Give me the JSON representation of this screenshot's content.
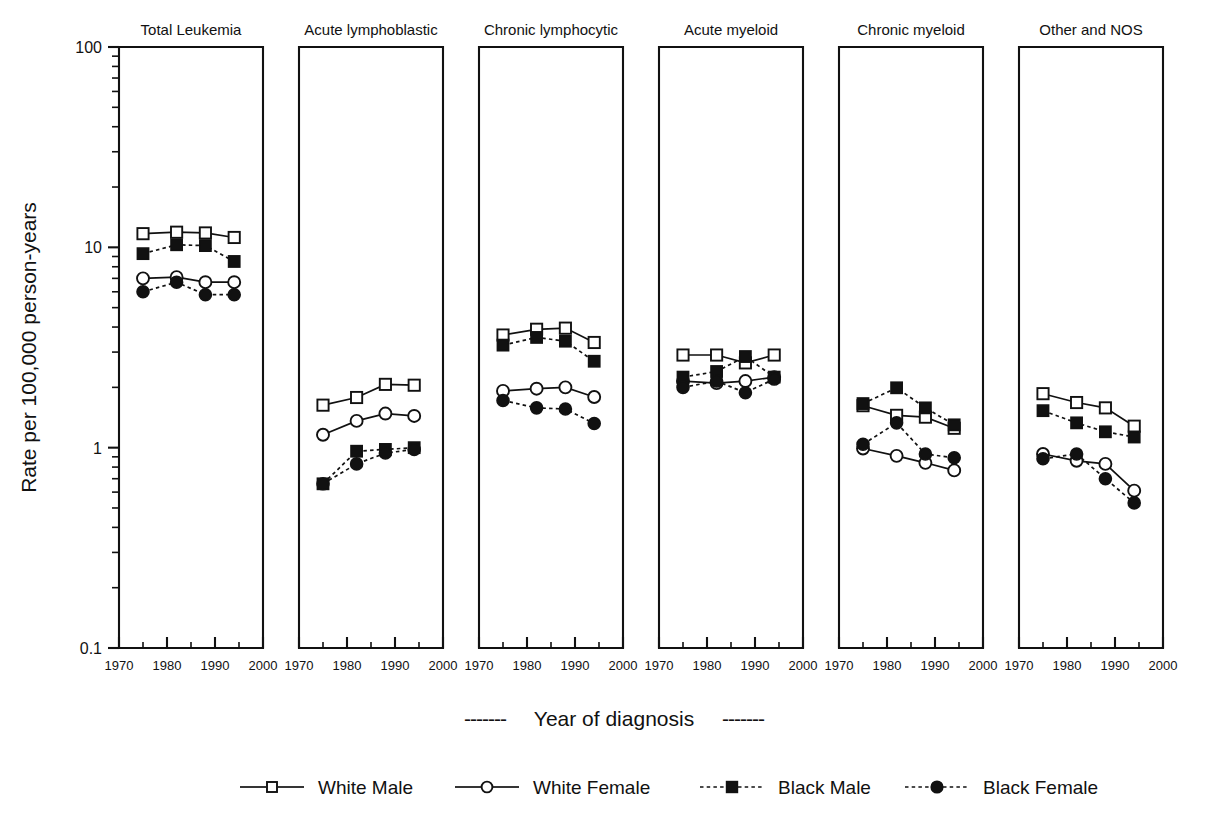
{
  "figure": {
    "ylabel": "Rate per 100,000 person-years",
    "xlabel": "Year of diagnosis",
    "xlabel_dash_left": "-------",
    "xlabel_dash_right": "-------"
  },
  "legend": {
    "items": [
      {
        "label": "White Male",
        "marker": "open-square",
        "line": "solid",
        "color": "#111111"
      },
      {
        "label": "White Female",
        "marker": "open-circle",
        "line": "solid",
        "color": "#111111"
      },
      {
        "label": "Black Male",
        "marker": "filled-square",
        "line": "dotted",
        "color": "#111111"
      },
      {
        "label": "Black Female",
        "marker": "filled-circle",
        "line": "dotted",
        "color": "#111111"
      }
    ]
  },
  "chart_data": {
    "type": "line",
    "title": "",
    "xlabel": "Year of diagnosis",
    "ylabel": "Rate per 100,000 person-years",
    "yscale": "log",
    "ylim": [
      0.1,
      100
    ],
    "ytick_labels": [
      "100",
      "10",
      "1",
      "0.1"
    ],
    "ytick_values": [
      100,
      10,
      1,
      0.1
    ],
    "xlim": [
      1970,
      2000
    ],
    "xtick_labels": [
      "1970",
      "1980",
      "1990",
      "2000"
    ],
    "xtick_values": [
      1970,
      1980,
      1990,
      2000
    ],
    "grid": false,
    "legend_position": "bottom",
    "x": [
      1975,
      1982,
      1988,
      1994
    ],
    "panels": [
      {
        "title": "Total Leukemia",
        "series": [
          {
            "name": "White Male",
            "values": [
              11.7,
              11.9,
              11.8,
              11.2
            ]
          },
          {
            "name": "White Female",
            "values": [
              7.0,
              7.1,
              6.7,
              6.7
            ]
          },
          {
            "name": "Black Male",
            "values": [
              9.3,
              10.3,
              10.2,
              8.5
            ]
          },
          {
            "name": "Black Female",
            "values": [
              6.0,
              6.7,
              5.8,
              5.8
            ]
          }
        ]
      },
      {
        "title": "Acute lymphoblastic",
        "series": [
          {
            "name": "White Male",
            "values": [
              1.63,
              1.78,
              2.07,
              2.05
            ]
          },
          {
            "name": "White Female",
            "values": [
              1.16,
              1.36,
              1.48,
              1.44
            ]
          },
          {
            "name": "Black Male",
            "values": [
              0.66,
              0.96,
              0.98,
              1.0
            ]
          },
          {
            "name": "Black Female",
            "values": [
              0.66,
              0.83,
              0.94,
              0.98
            ]
          }
        ]
      },
      {
        "title": "Chronic lymphocytic",
        "series": [
          {
            "name": "White Male",
            "values": [
              3.65,
              3.9,
              3.95,
              3.35
            ]
          },
          {
            "name": "White Female",
            "values": [
              1.92,
              1.97,
              2.0,
              1.79
            ]
          },
          {
            "name": "Black Male",
            "values": [
              3.25,
              3.55,
              3.4,
              2.7
            ]
          },
          {
            "name": "Black Female",
            "values": [
              1.72,
              1.58,
              1.56,
              1.32
            ]
          }
        ]
      },
      {
        "title": "Acute myeloid",
        "series": [
          {
            "name": "White Male",
            "values": [
              2.9,
              2.9,
              2.65,
              2.9
            ]
          },
          {
            "name": "White Female",
            "values": [
              2.15,
              2.1,
              2.15,
              2.25
            ]
          },
          {
            "name": "Black Male",
            "values": [
              2.25,
              2.4,
              2.85,
              2.25
            ]
          },
          {
            "name": "Black Female",
            "values": [
              2.0,
              2.15,
              1.88,
              2.2
            ]
          }
        ]
      },
      {
        "title": "Chronic myeloid",
        "series": [
          {
            "name": "White Male",
            "values": [
              1.62,
              1.45,
              1.42,
              1.25
            ]
          },
          {
            "name": "White Female",
            "values": [
              0.99,
              0.91,
              0.84,
              0.77
            ]
          },
          {
            "name": "Black Male",
            "values": [
              1.66,
              1.99,
              1.58,
              1.3
            ]
          },
          {
            "name": "Black Female",
            "values": [
              1.04,
              1.33,
              0.93,
              0.89
            ]
          }
        ]
      },
      {
        "title": "Other and NOS",
        "series": [
          {
            "name": "White Male",
            "values": [
              1.86,
              1.68,
              1.58,
              1.28
            ]
          },
          {
            "name": "White Female",
            "values": [
              0.93,
              0.86,
              0.83,
              0.61
            ]
          },
          {
            "name": "Black Male",
            "values": [
              1.53,
              1.33,
              1.2,
              1.13
            ]
          },
          {
            "name": "Black Female",
            "values": [
              0.88,
              0.93,
              0.7,
              0.53
            ]
          }
        ]
      }
    ]
  }
}
